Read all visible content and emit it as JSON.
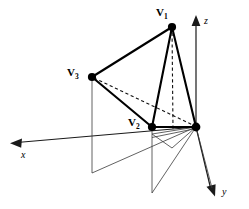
{
  "figure": {
    "background_color": "#ffffff",
    "stroke_color": "#000000",
    "thin_stroke_color": "#3a3a3a",
    "width": 249,
    "height": 209
  },
  "axes": {
    "origin_label": "",
    "items": [
      {
        "name": "x",
        "label": "x",
        "label_x": 21,
        "label_y": 151,
        "tip_x": 12,
        "tip_y": 143
      },
      {
        "name": "y",
        "label": "y",
        "label_x": 222,
        "label_y": 188,
        "tip_x": 215,
        "tip_y": 194
      },
      {
        "name": "z",
        "label": "z",
        "label_x": 204,
        "label_y": 17,
        "tip_x": 196,
        "tip_y": 17
      }
    ]
  },
  "vertices": [
    {
      "id": "v1",
      "label": "V",
      "sub": "1",
      "label_x": 156,
      "label_y": 8,
      "point_x": 172,
      "point_y": 27
    },
    {
      "id": "v3",
      "label": "V",
      "sub": "3",
      "label_x": 68,
      "label_y": 68,
      "point_x": 92,
      "point_y": 77
    },
    {
      "id": "v2",
      "label": "V",
      "sub": "2",
      "label_x": 129,
      "label_y": 118,
      "point_x": 152,
      "point_y": 127
    },
    {
      "id": "origin",
      "label": "",
      "sub": "",
      "label_x": 0,
      "label_y": 0,
      "point_x": 196,
      "point_y": 127
    }
  ],
  "geometry": {
    "solid_edges": [
      {
        "name": "edge-v1-v3",
        "x1": 172,
        "y1": 27,
        "x2": 92,
        "y2": 77
      },
      {
        "name": "edge-v1-v2",
        "x1": 172,
        "y1": 27,
        "x2": 152,
        "y2": 127
      },
      {
        "name": "edge-v1-origin",
        "x1": 172,
        "y1": 27,
        "x2": 196,
        "y2": 127
      },
      {
        "name": "edge-v3-v2",
        "x1": 92,
        "y1": 77,
        "x2": 152,
        "y2": 127
      },
      {
        "name": "edge-v2-origin",
        "x1": 152,
        "y1": 127,
        "x2": 196,
        "y2": 127
      }
    ],
    "dashed_edges": [
      {
        "name": "dashed-v1-base",
        "x1": 172,
        "y1": 27,
        "x2": 173,
        "y2": 128
      },
      {
        "name": "dashed-v3-origin",
        "x1": 92,
        "y1": 77,
        "x2": 196,
        "y2": 127
      }
    ],
    "projection_lines": [
      {
        "name": "vline-v3-floor",
        "x1": 92,
        "y1": 77,
        "x2": 92,
        "y2": 173
      },
      {
        "name": "vline-v2-floor",
        "x1": 152,
        "y1": 127,
        "x2": 152,
        "y2": 193
      },
      {
        "name": "floor-ray-left",
        "x1": 92,
        "y1": 173,
        "x2": 196,
        "y2": 127
      },
      {
        "name": "floor-ray-mid",
        "x1": 152,
        "y1": 193,
        "x2": 196,
        "y2": 127
      },
      {
        "name": "floor-ray-right",
        "x1": 196,
        "y1": 127,
        "x2": 213,
        "y2": 190
      },
      {
        "name": "floor-ray-inner",
        "x1": 196,
        "y1": 127,
        "x2": 173,
        "y2": 147
      },
      {
        "name": "floor-edge-inner",
        "x1": 152,
        "y1": 135,
        "x2": 196,
        "y2": 127
      },
      {
        "name": "floor-edge-step",
        "x1": 152,
        "y1": 135,
        "x2": 173,
        "y2": 147
      },
      {
        "name": "floor-edge-lower",
        "x1": 152,
        "y1": 137,
        "x2": 173,
        "y2": 147
      }
    ]
  }
}
